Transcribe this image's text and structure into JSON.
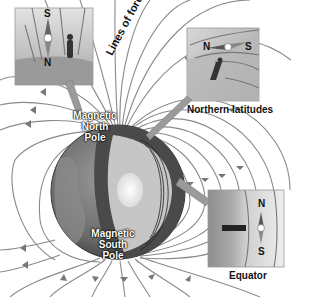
{
  "diagram": {
    "labels": {
      "lines_of_force": "Lines of force",
      "magnetic_north_pole": [
        "Magnetic",
        "North",
        "Pole"
      ],
      "magnetic_south_pole": [
        "Magnetic",
        "South",
        "Pole"
      ],
      "northern_latitudes": "Northern latitudes",
      "equator": "Equator"
    },
    "insets": [
      {
        "name": "pole-inset",
        "compass_top": "S",
        "compass_bottom": "N",
        "orientation": "vertical"
      },
      {
        "name": "northern-latitudes-inset",
        "compass_left": "N",
        "compass_right": "S",
        "orientation": "tilted"
      },
      {
        "name": "equator-inset",
        "compass_top": "N",
        "compass_bottom": "S",
        "orientation": "vertical"
      }
    ],
    "colors": {
      "field_line": "#8a8a8a",
      "globe_dark": "#555555",
      "globe_mid": "#7a7a7a",
      "core_light": "#c8c8c8",
      "inner_core": "#f2f2f2",
      "inset_bg": "#b5b5b5"
    }
  }
}
